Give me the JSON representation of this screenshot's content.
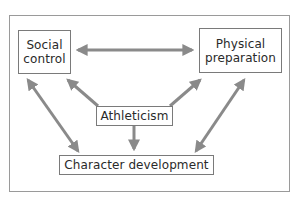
{
  "diagram": {
    "nodes": {
      "social_control": "Social\ncontrol",
      "physical_preparation": "Physical\npreparation",
      "athleticism": "Athleticism",
      "character_development": "Character development"
    },
    "edges": [
      {
        "from": "Social control",
        "to": "Physical preparation",
        "type": "bidirectional"
      },
      {
        "from": "Athleticism",
        "to": "Social control",
        "type": "directed"
      },
      {
        "from": "Athleticism",
        "to": "Physical preparation",
        "type": "directed"
      },
      {
        "from": "Athleticism",
        "to": "Character development",
        "type": "directed"
      },
      {
        "from": "Social control",
        "to": "Character development",
        "type": "bidirectional"
      },
      {
        "from": "Physical preparation",
        "to": "Character development",
        "type": "bidirectional"
      }
    ],
    "colors": {
      "arrow": "#8a8a8a",
      "box_border": "#7a7a7a",
      "frame_border": "#9a9a9a",
      "text": "#2a2a2a"
    }
  }
}
